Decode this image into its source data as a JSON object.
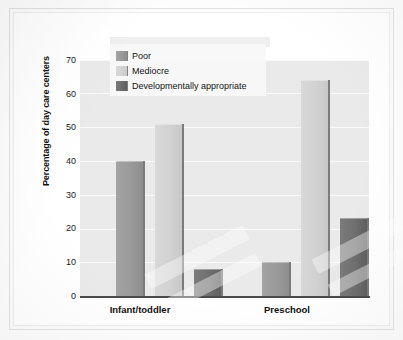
{
  "chart_data": {
    "type": "bar",
    "title": "",
    "xlabel": "",
    "ylabel": "Percentage of day care centers",
    "categories": [
      "Infant/toddler",
      "Preschool"
    ],
    "series": [
      {
        "name": "Poor",
        "values": [
          40,
          10
        ],
        "color": "#9a9a9a"
      },
      {
        "name": "Mediocre",
        "values": [
          51,
          64
        ],
        "color": "#d2d2d2"
      },
      {
        "name": "Developmentally appropriate",
        "values": [
          8,
          23
        ],
        "color": "#6f6f6f"
      }
    ],
    "ylim": [
      0,
      70
    ],
    "yticks": [
      0,
      10,
      20,
      30,
      40,
      50,
      60,
      70
    ],
    "ytick_labels": [
      "0",
      "10",
      "20",
      "30",
      "40",
      "50",
      "60",
      "70"
    ],
    "grid": true,
    "legend_position": "top-left-inside"
  },
  "axis": {
    "y_label": "Percentage of day care centers",
    "ticks": [
      "70",
      "60",
      "50",
      "40",
      "30",
      "20",
      "10",
      "0"
    ]
  },
  "legend": {
    "items": [
      {
        "label": "Poor",
        "swatch": "swatch-poor"
      },
      {
        "label": "Mediocre",
        "swatch": "swatch-mediocre"
      },
      {
        "label": "Developmentally appropriate",
        "swatch": "swatch-dev"
      }
    ]
  },
  "categories": [
    {
      "label": "Infant/toddler"
    },
    {
      "label": "Preschool"
    }
  ]
}
